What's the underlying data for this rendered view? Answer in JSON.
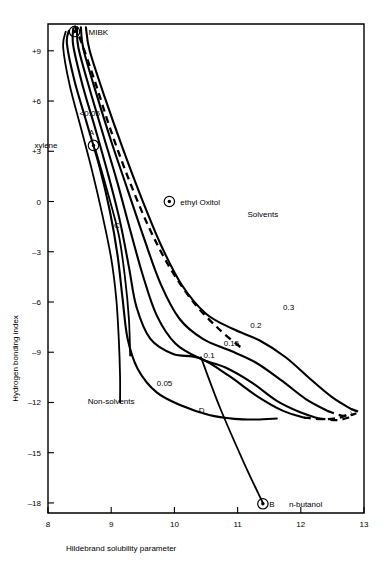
{
  "chart_data": {
    "type": "line",
    "title": "",
    "xlabel": "Hildebrand solubility parameter",
    "ylabel": "Hydrogen bonding index",
    "xlim": [
      8,
      13
    ],
    "ylim": [
      -18.6,
      10.6
    ],
    "xticks": [
      "8",
      "9",
      "10",
      "11",
      "12",
      "13"
    ],
    "xtick_values": [
      8,
      9,
      10,
      11,
      12,
      13
    ],
    "yticks": [
      "+9",
      "+6",
      "+3",
      "0",
      "-3",
      "-6",
      "-9",
      "-12",
      "-15",
      "-18"
    ],
    "ytick_values": [
      9,
      6,
      3,
      0,
      -3,
      -6,
      -9,
      -12,
      -15,
      -18
    ],
    "grid": false,
    "legend_position": "inline-curve-labels",
    "series": [
      {
        "name": "0.05",
        "label": "0.05",
        "label_x": 9.72,
        "label_y": -11.0,
        "style": "solid",
        "points": [
          [
            8.33,
            10.2
          ],
          [
            8.3,
            9.4
          ],
          [
            8.42,
            7.2
          ],
          [
            8.62,
            4.6
          ],
          [
            8.82,
            2.0
          ],
          [
            8.98,
            -0.6
          ],
          [
            9.1,
            -3.2
          ],
          [
            9.18,
            -5.8
          ],
          [
            9.26,
            -8.2
          ],
          [
            9.42,
            -10.0
          ],
          [
            9.72,
            -11.4
          ],
          [
            10.12,
            -12.2
          ],
          [
            10.55,
            -12.75
          ],
          [
            10.95,
            -12.98
          ],
          [
            11.3,
            -13.02
          ],
          [
            11.62,
            -12.96
          ]
        ]
      },
      {
        "name": "0.1",
        "label": "0.1",
        "label_x": 10.46,
        "label_y": -9.35,
        "style": "solid-with-dashed-tail",
        "points": [
          [
            8.4,
            10.35
          ],
          [
            8.4,
            9.3
          ],
          [
            8.55,
            6.9
          ],
          [
            8.76,
            4.2
          ],
          [
            8.96,
            1.5
          ],
          [
            9.14,
            -1.2
          ],
          [
            9.28,
            -3.9
          ],
          [
            9.4,
            -6.3
          ],
          [
            9.62,
            -8.2
          ],
          [
            9.98,
            -9.1
          ],
          [
            10.4,
            -9.35
          ],
          [
            10.86,
            -10.4
          ],
          [
            11.3,
            -11.6
          ],
          [
            11.72,
            -12.5
          ],
          [
            12.05,
            -12.9
          ]
        ],
        "dashed_tail": [
          [
            12.05,
            -12.9
          ],
          [
            12.35,
            -13.0
          ],
          [
            12.62,
            -12.9
          ],
          [
            12.8,
            -12.6
          ]
        ]
      },
      {
        "name": "0.15",
        "label": "0.15",
        "label_x": 10.78,
        "label_y": -8.6,
        "style": "solid-with-dashed-tail",
        "points": [
          [
            8.46,
            10.4
          ],
          [
            8.48,
            9.2
          ],
          [
            8.66,
            6.7
          ],
          [
            8.88,
            3.9
          ],
          [
            9.1,
            1.1
          ],
          [
            9.3,
            -1.7
          ],
          [
            9.5,
            -4.4
          ],
          [
            9.72,
            -6.8
          ],
          [
            10.02,
            -8.5
          ],
          [
            10.42,
            -9.4
          ],
          [
            10.8,
            -9.9
          ],
          [
            11.22,
            -10.8
          ],
          [
            11.62,
            -11.9
          ],
          [
            12.0,
            -12.6
          ],
          [
            12.28,
            -12.95
          ]
        ],
        "dashed_tail": [
          [
            12.28,
            -12.95
          ],
          [
            12.58,
            -13.05
          ],
          [
            12.8,
            -12.85
          ]
        ]
      },
      {
        "name": "0.2",
        "label": "0.2",
        "label_x": 11.2,
        "label_y": -7.55,
        "style": "solid-with-dashed-tail",
        "points": [
          [
            8.52,
            10.4
          ],
          [
            8.56,
            9.1
          ],
          [
            8.76,
            6.5
          ],
          [
            9.0,
            3.6
          ],
          [
            9.26,
            0.7
          ],
          [
            9.52,
            -2.2
          ],
          [
            9.78,
            -4.9
          ],
          [
            10.08,
            -7.0
          ],
          [
            10.45,
            -8.2
          ],
          [
            10.88,
            -8.9
          ],
          [
            11.28,
            -9.6
          ],
          [
            11.7,
            -10.7
          ],
          [
            12.08,
            -11.8
          ],
          [
            12.42,
            -12.5
          ]
        ],
        "dashed_tail": [
          [
            12.42,
            -12.5
          ],
          [
            12.68,
            -12.8
          ],
          [
            12.88,
            -12.65
          ]
        ]
      },
      {
        "name": "0.3",
        "label": "0.3",
        "label_x": 11.72,
        "label_y": -6.5,
        "style": "solid-with-dashed-tail",
        "points": [
          [
            8.6,
            10.4
          ],
          [
            8.66,
            9.0
          ],
          [
            8.9,
            6.2
          ],
          [
            9.18,
            3.2
          ],
          [
            9.48,
            0.2
          ],
          [
            9.8,
            -2.7
          ],
          [
            10.12,
            -5.0
          ],
          [
            10.5,
            -6.7
          ],
          [
            10.92,
            -7.6
          ],
          [
            11.35,
            -8.3
          ],
          [
            11.76,
            -9.3
          ],
          [
            12.15,
            -10.6
          ],
          [
            12.5,
            -11.7
          ],
          [
            12.8,
            -12.4
          ]
        ],
        "dashed_tail": [
          [
            12.8,
            -12.4
          ],
          [
            12.95,
            -12.6
          ]
        ]
      },
      {
        "name": "outer-boundary",
        "label": "",
        "style": "dashed",
        "points": [
          [
            8.42,
            10.5
          ],
          [
            8.52,
            9.6
          ],
          [
            8.74,
            7.2
          ],
          [
            8.98,
            4.4
          ],
          [
            9.26,
            1.5
          ],
          [
            9.58,
            -1.4
          ],
          [
            9.92,
            -3.9
          ],
          [
            10.3,
            -6.0
          ],
          [
            10.7,
            -7.6
          ],
          [
            11.08,
            -8.8
          ]
        ]
      },
      {
        "name": "lt-0.05-inner",
        "label": "<0.05",
        "label_x": 8.5,
        "label_y": 5.1,
        "style": "solid",
        "points": [
          [
            8.28,
            10.15
          ],
          [
            8.24,
            9.2
          ],
          [
            8.34,
            7.0
          ],
          [
            8.52,
            4.4
          ],
          [
            8.7,
            1.8
          ],
          [
            8.86,
            -0.8
          ],
          [
            9.0,
            -3.4
          ],
          [
            9.08,
            -5.8
          ],
          [
            9.12,
            -8.2
          ],
          [
            9.14,
            -10.4
          ],
          [
            9.14,
            -12.0
          ]
        ]
      },
      {
        "name": "A-to-C-tie",
        "label": "",
        "style": "solid",
        "points": [
          [
            8.75,
            3.1
          ],
          [
            8.94,
            0.6
          ],
          [
            9.12,
            -2.0
          ],
          [
            9.22,
            -4.6
          ],
          [
            9.28,
            -7.0
          ],
          [
            9.3,
            -9.2
          ]
        ]
      },
      {
        "name": "B-tie-line",
        "label": "",
        "style": "solid",
        "points": [
          [
            10.42,
            -9.3
          ],
          [
            10.72,
            -12.3
          ],
          [
            11.1,
            -15.6
          ],
          [
            11.4,
            -18.0
          ]
        ]
      }
    ],
    "annotations": [
      {
        "name": "MIBK",
        "label": "MIBK",
        "x": 8.42,
        "y": 10.15,
        "marker": "ringed-dot",
        "label_dx": 14,
        "label_dy": 3
      },
      {
        "name": "xylene",
        "label": "xylene",
        "point_label": "A",
        "x": 8.72,
        "y": 3.35,
        "marker": "ringed-dot",
        "label_dx": -36,
        "label_dy": 3,
        "point_label_dx": -2,
        "point_label_dy": -10
      },
      {
        "name": "ethyl-oxitol",
        "label": "ethyl Oxitol",
        "x": 9.92,
        "y": 0.0,
        "marker": "ringed-dot",
        "label_dx": 11,
        "label_dy": 3
      },
      {
        "name": "n-butanol",
        "label": "n-butanol",
        "point_label": "B",
        "x": 11.4,
        "y": -18.05,
        "marker": "ringed-dot",
        "label_dx": 26,
        "label_dy": 3,
        "point_label_dx": 9,
        "point_label_dy": 3
      },
      {
        "name": "point-C",
        "label": "C",
        "x": 9.28,
        "y": -1.6,
        "marker": "none",
        "label_dx": -9,
        "label_dy": 0
      },
      {
        "name": "point-D",
        "label": "D",
        "x": 10.62,
        "y": -12.6,
        "marker": "none",
        "label_dx": -9,
        "label_dy": 0
      }
    ],
    "region_labels": [
      {
        "name": "solvents-region",
        "text": "Solvents",
        "x": 11.4,
        "y": -0.9
      },
      {
        "name": "non-solvents-region",
        "text": "Non-solvents",
        "x": 9.0,
        "y": -12.1
      }
    ]
  }
}
